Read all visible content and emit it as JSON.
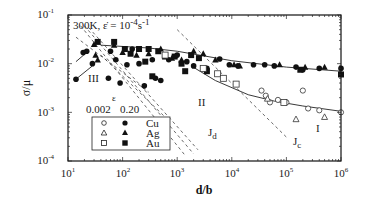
{
  "chart_data": {
    "type": "scatter",
    "title": "",
    "xlabel": "d/b",
    "ylabel": "σ/μ",
    "xscale": "log",
    "yscale": "log",
    "xlim": [
      10,
      1000000
    ],
    "ylim": [
      0.0001,
      0.1
    ],
    "grid": false,
    "x_ticks": [
      {
        "base": "10",
        "exp": "1",
        "value": 10
      },
      {
        "base": "10",
        "exp": "2",
        "value": 100
      },
      {
        "base": "10",
        "exp": "3",
        "value": 1000
      },
      {
        "base": "10",
        "exp": "4",
        "value": 10000
      },
      {
        "base": "10",
        "exp": "5",
        "value": 100000
      },
      {
        "base": "10",
        "exp": "6",
        "value": 1000000
      }
    ],
    "y_ticks": [
      {
        "base": "10",
        "exp": "-1",
        "value": 0.1
      },
      {
        "base": "10",
        "exp": "-2",
        "value": 0.01
      },
      {
        "base": "10",
        "exp": "-3",
        "value": 0.001
      },
      {
        "base": "10",
        "exp": "-4",
        "value": 0.0001
      }
    ],
    "condition_label": "300K, ε̇ = 10⁻⁴s⁻¹",
    "condition_parts": {
      "temp": "300K, ",
      "rate_sym": "ε̇",
      "eq": " = 10",
      "exp1": "-4",
      "unit": "s",
      "exp2": "-1"
    },
    "regions": [
      {
        "label": "III",
        "x": 30,
        "y": 0.0055
      },
      {
        "label": "II",
        "x": 2000,
        "y": 0.0025
      },
      {
        "label": "I",
        "x": 400000,
        "y": 0.0005
      }
    ],
    "line_labels": [
      {
        "label": "J",
        "sub": "d",
        "x": 2800,
        "y": 0.00032
      },
      {
        "label": "J",
        "sub": "c",
        "x": 130000,
        "y": 0.00032
      }
    ],
    "legend": {
      "position": "lower-left",
      "header_symbol": "ε",
      "columns": [
        "0.002",
        "0.20"
      ],
      "rows": [
        {
          "metal": "Cu",
          "open": "circle-open",
          "filled": "circle-filled"
        },
        {
          "metal": "Ag",
          "open": "triangle-open",
          "filled": "triangle-filled"
        },
        {
          "metal": "Au",
          "open": "square-open",
          "filled": "square-filled"
        }
      ]
    },
    "dashed_lines": [
      {
        "name": "Jd-1",
        "points": [
          [
            17,
            0.06
          ],
          [
            1400,
            0.00013
          ]
        ]
      },
      {
        "name": "Jd-2",
        "points": [
          [
            20,
            0.06
          ],
          [
            2000,
            0.00014
          ]
        ]
      },
      {
        "name": "Jd-3",
        "points": [
          [
            24,
            0.055
          ],
          [
            2400,
            0.00017
          ]
        ]
      },
      {
        "name": "Jc-1",
        "points": [
          [
            1000,
            0.05
          ],
          [
            100000,
            0.00031
          ]
        ]
      },
      {
        "name": "Jc-2",
        "points": [
          [
            14,
            0.035
          ],
          [
            300,
            0.0026
          ]
        ]
      },
      {
        "name": "E",
        "points": [
          [
            40,
            0.015
          ],
          [
            600,
            0.0008
          ]
        ]
      }
    ],
    "solid_lines": [
      {
        "name": "eps-0.20-fit",
        "points": [
          [
            40,
            0.024
          ],
          [
            300,
            0.021
          ],
          [
            1000,
            0.018
          ],
          [
            10000,
            0.0115
          ],
          [
            100000,
            0.0085
          ],
          [
            1000000,
            0.007
          ]
        ]
      },
      {
        "name": "eps-0.002-fit",
        "points": [
          [
            1800,
            0.009
          ],
          [
            5000,
            0.0045
          ],
          [
            20000,
            0.0023
          ],
          [
            60000,
            0.0017
          ],
          [
            200000,
            0.00135
          ],
          [
            1000000,
            0.00105
          ]
        ]
      },
      {
        "name": "Cu-III-link-1",
        "points": [
          [
            14,
            0.011
          ],
          [
            22,
            0.017
          ]
        ]
      },
      {
        "name": "Cu-III-link-2",
        "points": [
          [
            14,
            0.0048
          ],
          [
            28,
            0.009
          ]
        ]
      }
    ],
    "series": [
      {
        "name": "Cu ε=0.20",
        "marker": "circle-filled",
        "points": [
          [
            14,
            0.0048
          ],
          [
            19,
            0.017
          ],
          [
            22,
            0.018
          ],
          [
            28,
            0.01
          ],
          [
            55,
            0.005
          ],
          [
            60,
            0.018
          ],
          [
            75,
            0.012
          ],
          [
            90,
            0.004
          ],
          [
            120,
            0.0095
          ],
          [
            150,
            0.02
          ],
          [
            200,
            0.01
          ],
          [
            250,
            0.0035
          ],
          [
            350,
            0.012
          ],
          [
            400,
            0.005
          ],
          [
            500,
            0.0045
          ],
          [
            700,
            0.012
          ],
          [
            1000,
            0.015
          ],
          [
            1500,
            0.011
          ],
          [
            2000,
            0.009
          ],
          [
            3500,
            0.008
          ],
          [
            6000,
            0.0125
          ],
          [
            9000,
            0.0095
          ],
          [
            13000,
            0.009
          ],
          [
            25000,
            0.0095
          ],
          [
            40000,
            0.0095
          ],
          [
            60000,
            0.009
          ],
          [
            150000,
            0.0085
          ],
          [
            200000,
            0.0075
          ],
          [
            400000,
            0.008
          ],
          [
            1000000,
            0.008
          ]
        ]
      },
      {
        "name": "Ag ε=0.20",
        "marker": "triangle-filled",
        "points": [
          [
            30,
            0.025
          ],
          [
            32,
            0.015
          ],
          [
            35,
            0.012
          ],
          [
            70,
            0.024
          ],
          [
            100,
            0.017
          ],
          [
            180,
            0.015
          ],
          [
            300,
            0.016
          ],
          [
            500,
            0.02
          ],
          [
            800,
            0.013
          ],
          [
            1200,
            0.012
          ],
          [
            2000,
            0.018
          ],
          [
            3000,
            0.016
          ],
          [
            5000,
            0.012
          ],
          [
            11000,
            0.0095
          ],
          [
            14000,
            0.009
          ],
          [
            75000,
            0.0095
          ],
          [
            220000,
            0.0085
          ],
          [
            500000,
            0.0085
          ]
        ]
      },
      {
        "name": "Au ε=0.20",
        "marker": "square-filled",
        "points": [
          [
            35,
            0.028
          ],
          [
            70,
            0.028
          ],
          [
            110,
            0.02
          ],
          [
            140,
            0.016
          ],
          [
            200,
            0.02
          ],
          [
            260,
            0.011
          ],
          [
            300,
            0.02
          ],
          [
            350,
            0.0055
          ],
          [
            450,
            0.018
          ],
          [
            600,
            0.014
          ],
          [
            900,
            0.014
          ],
          [
            1200,
            0.01
          ],
          [
            1400,
            0.007
          ],
          [
            1800,
            0.015
          ],
          [
            2500,
            0.013
          ],
          [
            3500,
            0.007
          ],
          [
            180000,
            0.0075
          ],
          [
            1000000,
            0.006
          ]
        ]
      },
      {
        "name": "Cu ε=0.002",
        "marker": "circle-open",
        "points": [
          [
            35000,
            0.0028
          ],
          [
            42000,
            0.0022
          ],
          [
            50000,
            0.0016
          ],
          [
            70000,
            0.0018
          ],
          [
            100000,
            0.0016
          ],
          [
            200000,
            0.0028
          ],
          [
            250000,
            0.0012
          ],
          [
            400000,
            0.0011
          ],
          [
            1000000,
            0.001
          ]
        ]
      },
      {
        "name": "Ag ε=0.002",
        "marker": "triangle-open",
        "points": [
          [
            45000,
            0.0019
          ],
          [
            150000,
            0.00072
          ],
          [
            500000,
            0.0008
          ]
        ]
      },
      {
        "name": "Au ε=0.002",
        "marker": "square-open",
        "points": [
          [
            600,
            0.015
          ],
          [
            3000,
            0.008
          ],
          [
            5500,
            0.0062
          ],
          [
            7000,
            0.005
          ],
          [
            12000,
            0.0038
          ],
          [
            90000,
            0.0016
          ]
        ]
      }
    ]
  }
}
